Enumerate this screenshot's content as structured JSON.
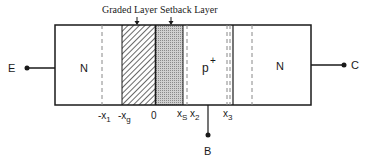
{
  "diagram": {
    "callouts": {
      "graded_layer": "Graded Layer",
      "setback_layer": "Setback Layer"
    },
    "regions": {
      "emitter": "N",
      "base": "p",
      "base_superscript": "+",
      "collector": "N"
    },
    "terminals": {
      "emitter": "E",
      "base": "B",
      "collector": "C"
    },
    "axis_labels": {
      "neg_x1_prefix": "-x",
      "neg_x1_sub": "1",
      "neg_xg_prefix": "-x",
      "neg_xg_sub": "g",
      "zero": "0",
      "xs_prefix": "x",
      "xs_sub": "S",
      "x2_prefix": "x",
      "x2_sub": "2",
      "x3_prefix": "x",
      "x3_sub": "3"
    },
    "colors": {
      "line": "#1a1a1a",
      "dashed": "#888888",
      "setback_fill": "#c8c8c8",
      "hatch": "#444444"
    }
  }
}
